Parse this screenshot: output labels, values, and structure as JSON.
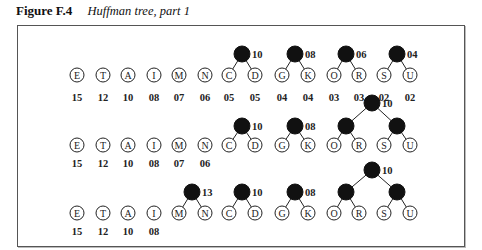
{
  "caption": {
    "figure_label": "Figure F.4",
    "title": "Huffman tree, part 1"
  },
  "rows": [
    {
      "leaves": [
        {
          "letter": "E",
          "freq": "15"
        },
        {
          "letter": "T",
          "freq": "12"
        },
        {
          "letter": "A",
          "freq": "10"
        },
        {
          "letter": "I",
          "freq": "08"
        },
        {
          "letter": "M",
          "freq": "07"
        },
        {
          "letter": "N",
          "freq": "06"
        },
        {
          "letter": "C",
          "freq": "05"
        },
        {
          "letter": "D",
          "freq": "05"
        },
        {
          "letter": "G",
          "freq": "04"
        },
        {
          "letter": "K",
          "freq": "04"
        },
        {
          "letter": "O",
          "freq": "03"
        },
        {
          "letter": "R",
          "freq": "03"
        },
        {
          "letter": "S",
          "freq": "02"
        },
        {
          "letter": "U",
          "freq": "02"
        }
      ],
      "subtrees": [
        {
          "children": [
            "C",
            "D"
          ],
          "weight": "10"
        },
        {
          "children": [
            "G",
            "K"
          ],
          "weight": "08"
        },
        {
          "children": [
            "O",
            "R"
          ],
          "weight": "06"
        },
        {
          "children": [
            "S",
            "U"
          ],
          "weight": "04"
        }
      ]
    },
    {
      "leaves": [
        {
          "letter": "E",
          "freq": "15"
        },
        {
          "letter": "T",
          "freq": "12"
        },
        {
          "letter": "A",
          "freq": "10"
        },
        {
          "letter": "I",
          "freq": "08"
        },
        {
          "letter": "M",
          "freq": "07"
        },
        {
          "letter": "N",
          "freq": "06"
        },
        {
          "letter": "C",
          "freq": ""
        },
        {
          "letter": "D",
          "freq": ""
        },
        {
          "letter": "G",
          "freq": ""
        },
        {
          "letter": "K",
          "freq": ""
        },
        {
          "letter": "O",
          "freq": ""
        },
        {
          "letter": "R",
          "freq": ""
        },
        {
          "letter": "S",
          "freq": ""
        },
        {
          "letter": "U",
          "freq": ""
        }
      ],
      "subtrees": [
        {
          "children": [
            "C",
            "D"
          ],
          "weight": "10"
        },
        {
          "children": [
            "G",
            "K"
          ],
          "weight": "08"
        },
        {
          "children": [
            "O",
            "R",
            "S",
            "U"
          ],
          "weight": "10"
        }
      ]
    },
    {
      "leaves": [
        {
          "letter": "E",
          "freq": "15"
        },
        {
          "letter": "T",
          "freq": "12"
        },
        {
          "letter": "A",
          "freq": "10"
        },
        {
          "letter": "I",
          "freq": "08"
        },
        {
          "letter": "M",
          "freq": ""
        },
        {
          "letter": "N",
          "freq": ""
        },
        {
          "letter": "C",
          "freq": ""
        },
        {
          "letter": "D",
          "freq": ""
        },
        {
          "letter": "G",
          "freq": ""
        },
        {
          "letter": "K",
          "freq": ""
        },
        {
          "letter": "O",
          "freq": ""
        },
        {
          "letter": "R",
          "freq": ""
        },
        {
          "letter": "S",
          "freq": ""
        },
        {
          "letter": "U",
          "freq": ""
        }
      ],
      "subtrees": [
        {
          "children": [
            "M",
            "N"
          ],
          "weight": "13"
        },
        {
          "children": [
            "C",
            "D"
          ],
          "weight": "10"
        },
        {
          "children": [
            "G",
            "K"
          ],
          "weight": "08"
        },
        {
          "children": [
            "O",
            "R",
            "S",
            "U"
          ],
          "weight": "10"
        }
      ]
    }
  ]
}
